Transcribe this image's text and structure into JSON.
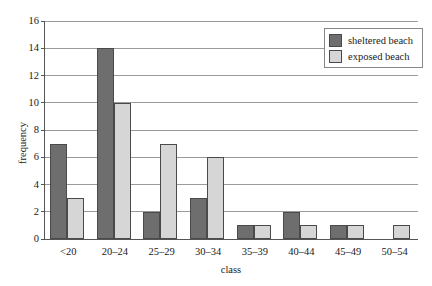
{
  "chart_data": {
    "type": "bar",
    "title": "",
    "xlabel": "class",
    "ylabel": "frequency",
    "categories": [
      "<20",
      "20–24",
      "25–29",
      "30–34",
      "35–39",
      "40–44",
      "45–49",
      "50–54"
    ],
    "series": [
      {
        "name": "sheltered beach",
        "color": "#6E6E6E",
        "values": [
          7,
          14,
          2,
          3,
          1,
          2,
          1,
          0
        ]
      },
      {
        "name": "exposed beach",
        "color": "#D6D6D6",
        "values": [
          3,
          10,
          7,
          6,
          1,
          1,
          1,
          1
        ]
      }
    ],
    "ylim": [
      0,
      16
    ],
    "ytick_step": 2,
    "yticks": [
      "0",
      "2",
      "4",
      "6",
      "8",
      "10",
      "12",
      "14",
      "16"
    ],
    "grid": "horizontal",
    "legend_position": "top-right",
    "grouping": "grouped"
  },
  "legend": {
    "entries": [
      {
        "label": "sheltered beach",
        "swatch": "legend-swatch-sheltered"
      },
      {
        "label": "exposed beach",
        "swatch": "legend-swatch-exposed"
      }
    ]
  },
  "colors": {
    "series_sheltered": "#6E6E6E",
    "series_exposed": "#D6D6D6",
    "gridline": "#9A9A9A",
    "axis": "#555555",
    "bar_border": "#4A4A4A",
    "background": "#FFFFFF"
  }
}
